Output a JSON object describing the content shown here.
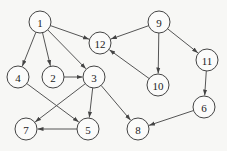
{
  "diagram": {
    "type": "directed-graph",
    "node_radius": 11,
    "colors": {
      "background": "#f7f7f5",
      "edge": "#555555",
      "node_stroke": "#444444",
      "text": "#222222"
    },
    "nodes": [
      {
        "id": "1",
        "label": "1",
        "x": 40,
        "y": 22
      },
      {
        "id": "12",
        "label": "12",
        "x": 100,
        "y": 43
      },
      {
        "id": "9",
        "label": "9",
        "x": 159,
        "y": 22
      },
      {
        "id": "11",
        "label": "11",
        "x": 207,
        "y": 60
      },
      {
        "id": "10",
        "label": "10",
        "x": 158,
        "y": 85
      },
      {
        "id": "4",
        "label": "4",
        "x": 18,
        "y": 77
      },
      {
        "id": "2",
        "label": "2",
        "x": 53,
        "y": 77
      },
      {
        "id": "3",
        "label": "3",
        "x": 94,
        "y": 77
      },
      {
        "id": "6",
        "label": "6",
        "x": 204,
        "y": 107
      },
      {
        "id": "7",
        "label": "7",
        "x": 26,
        "y": 129
      },
      {
        "id": "5",
        "label": "5",
        "x": 88,
        "y": 129
      },
      {
        "id": "8",
        "label": "8",
        "x": 138,
        "y": 129
      }
    ],
    "edges": [
      {
        "from": "1",
        "to": "4"
      },
      {
        "from": "1",
        "to": "2"
      },
      {
        "from": "1",
        "to": "3"
      },
      {
        "from": "1",
        "to": "12"
      },
      {
        "from": "9",
        "to": "12"
      },
      {
        "from": "9",
        "to": "10"
      },
      {
        "from": "9",
        "to": "11"
      },
      {
        "from": "10",
        "to": "12"
      },
      {
        "from": "11",
        "to": "6"
      },
      {
        "from": "6",
        "to": "8"
      },
      {
        "from": "2",
        "to": "3"
      },
      {
        "from": "3",
        "to": "7"
      },
      {
        "from": "3",
        "to": "5"
      },
      {
        "from": "3",
        "to": "8"
      },
      {
        "from": "4",
        "to": "5"
      },
      {
        "from": "5",
        "to": "7"
      }
    ]
  }
}
